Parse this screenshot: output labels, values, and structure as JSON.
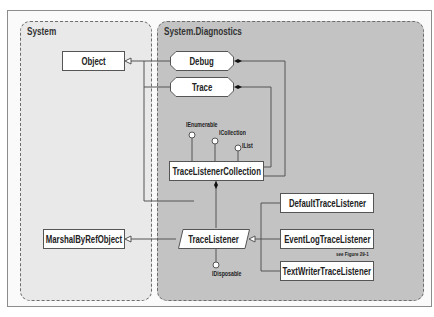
{
  "namespaces": {
    "system": {
      "label": "System"
    },
    "diagnostics": {
      "label": "System.Diagnostics"
    }
  },
  "classes": {
    "object": "Object",
    "marshal": "MarshalByRefObject",
    "debug": "Debug",
    "trace": "Trace",
    "collection": "TraceListenerCollection",
    "listener": "TraceListener",
    "default_listener": "DefaultTraceListener",
    "eventlog_listener": "EventLogTraceListener",
    "textwriter_listener": "TextWriterTraceListener"
  },
  "interfaces": {
    "ienumerable": "IEnumerable",
    "icollection": "ICollection",
    "ilist": "IList",
    "idisposable": "IDisposable"
  },
  "notes": {
    "see_figure": "see Figure 29-1"
  },
  "colors": {
    "system_panel": "#e9e9e9",
    "diagnostics_panel": "#c3c3c3",
    "line": "#555555"
  }
}
